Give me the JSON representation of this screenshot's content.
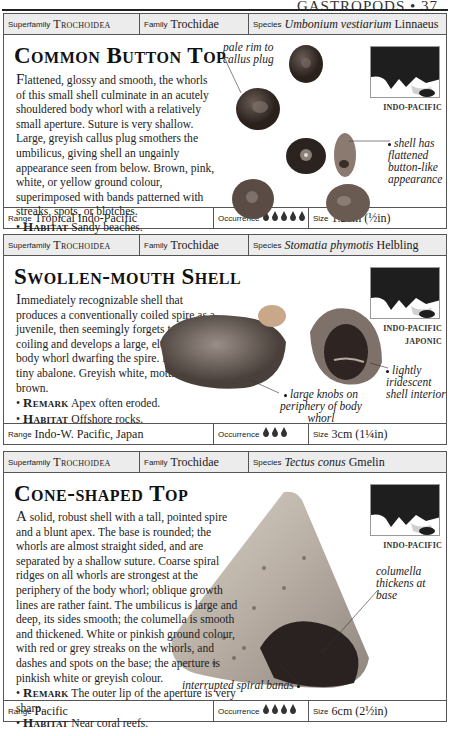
{
  "page": {
    "running_head": "GASTROPODS • 37"
  },
  "labels": {
    "superfamily": "Superfamily",
    "family": "Family",
    "species": "Species",
    "range": "Range",
    "occurrence": "Occurrence",
    "size": "Size",
    "remark": "Remark",
    "habitat": "Habitat"
  },
  "entries": [
    {
      "superfamily": "Trochoidea",
      "family": "Trochidae",
      "species_italic": "Umbonium vestiarium",
      "species_author": "Linnaeus",
      "title": "Common Button Top",
      "desc_first": "F",
      "desc_rest": "lattened, glossy and smooth, the whorls of this small shell culminate in an acutely shouldered body whorl with a relatively small aperture. Suture is very shallow. Large, greyish callus plug smothers the umbilicus, giving shell an ungainly appearance seen from below. Brown, pink, white, or yellow ground colour, superimposed with bands patterned with streaks, spots, or blotches.",
      "habitat": "Sandy beaches.",
      "map_caption": [
        "INDO-PACIFIC"
      ],
      "annotations": [
        "pale rim to callus plug",
        "shell has flattened button-like appearance"
      ],
      "range": "Tropical Indo-Pacific",
      "occurrence_count": 5,
      "occurrence_icon": "shell-icon",
      "size": "1.2cm (½in)"
    },
    {
      "superfamily": "Trochoidea",
      "family": "Trochidae",
      "species_italic": "Stomatia phymotis",
      "species_author": "Helbling",
      "title": "Swollen-mouth Shell",
      "desc_first": "I",
      "desc_rest": "mmediately recognizable shell that produces a conventionally coiled spire as a juvenile, then seemingly forgets to continue coiling and develops a large, elongated body whorl dwarfing the spire. Looks like a tiny abalone. Greyish white, mottled with brown.",
      "remark": "Apex often eroded.",
      "habitat": "Offshore rocks.",
      "map_caption": [
        "INDO-PACIFIC",
        "JAPONIC"
      ],
      "annotations": [
        "large knobs on periphery of body whorl",
        "lightly iridescent shell interior"
      ],
      "range": "Indo-W. Pacific, Japan",
      "occurrence_count": 3,
      "occurrence_icon": "shell-icon",
      "size": "3cm (1¼in)"
    },
    {
      "superfamily": "Trochoidea",
      "family": "Trochidae",
      "species_italic": "Tectus conus",
      "species_author": "Gmelin",
      "title": "Cone-shaped Top",
      "desc_first": "A",
      "desc_rest": " solid, robust shell with a tall, pointed spire and a blunt apex. The base is rounded; the whorls are almost straight sided, and are separated by a shallow suture. Coarse spiral ridges on all whorls are strongest at the periphery of the body whorl; oblique growth lines are rather faint. The umbilicus is large and deep, its sides smooth; the columella is smooth and thickened. White or pinkish ground colour, with red or grey streaks on the whorls, and dashes and spots on the base; the aperture is pinkish white or greyish colour.",
      "remark": "The outer lip of the aperture is very sharp.",
      "habitat": "Near coral reefs.",
      "map_caption": [
        "INDO-PACIFIC"
      ],
      "annotations": [
        "columella thickens at base",
        "interrupted spiral bands"
      ],
      "range": "Pacific",
      "occurrence_count": 4,
      "occurrence_icon": "shell-icon",
      "size": "6cm (2½in)"
    }
  ]
}
